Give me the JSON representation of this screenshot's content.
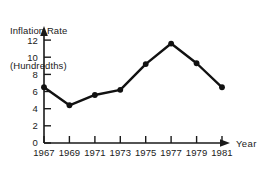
{
  "chart_data": {
    "type": "line",
    "title": "Inflation Rate (Hundredths)",
    "title_lines": [
      "Inflation Rate",
      "(Hundredths)"
    ],
    "xlabel": "Year",
    "ylabel": "",
    "categories": [
      "1967",
      "1969",
      "1971",
      "1973",
      "1975",
      "1977",
      "1979",
      "1981"
    ],
    "x": [
      1967,
      1969,
      1971,
      1973,
      1975,
      1977,
      1979,
      1981
    ],
    "values": [
      6.5,
      4.4,
      5.6,
      6.2,
      9.2,
      11.6,
      9.3,
      6.5
    ],
    "series": [
      {
        "name": "Inflation Rate",
        "values": [
          6.5,
          4.4,
          5.6,
          6.2,
          9.2,
          11.6,
          9.3,
          6.5
        ]
      }
    ],
    "ylim": [
      0,
      13
    ],
    "xlim": [
      1967,
      1982.6
    ],
    "yticks": [
      0,
      2,
      4,
      6,
      8,
      10,
      12
    ],
    "ytick_labels": [
      "0",
      "2",
      "4",
      "6",
      "8",
      "10",
      "12"
    ],
    "xticks": [
      1967,
      1969,
      1971,
      1973,
      1975,
      1977,
      1979,
      1981
    ],
    "xtick_labels": [
      "1967",
      "1969",
      "1971",
      "1973",
      "1975",
      "1977",
      "1979",
      "1981"
    ],
    "grid": false,
    "legend": false,
    "legend_position": "none",
    "marker": "filled-circle",
    "line_color": "#111111",
    "marker_color": "#111111",
    "background_color": "#ffffff",
    "axis_color": "#1a1a1a",
    "x_axis_arrow": true,
    "y_axis_arrow": true
  }
}
